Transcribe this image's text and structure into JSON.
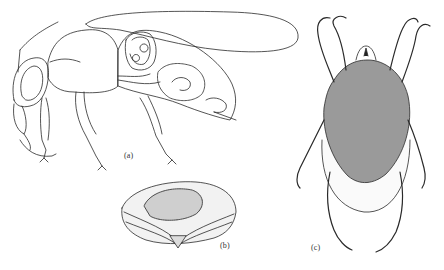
{
  "figure": {
    "panels": [
      {
        "id": "a",
        "label": "(a)",
        "subject": "bee-side-view-internal-anatomy"
      },
      {
        "id": "b",
        "label": "(b)",
        "subject": "dissected-structure-cross-section"
      },
      {
        "id": "c",
        "label": "(c)",
        "subject": "mite-dorsal-view"
      }
    ]
  },
  "colors": {
    "background": "#ffffff",
    "line": "#2a2a2a",
    "hatch": "#555555",
    "label": "#333333"
  }
}
